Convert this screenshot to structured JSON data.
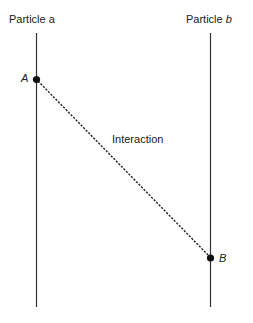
{
  "diagram": {
    "particles": [
      {
        "id": "a",
        "prefix": "Particle ",
        "name": "a",
        "name_italic": false
      },
      {
        "id": "b",
        "prefix": "Particle ",
        "name": "b",
        "name_italic": true
      }
    ],
    "events": [
      {
        "id": "A",
        "label": "A",
        "on_particle": "a"
      },
      {
        "id": "B",
        "label": "B",
        "on_particle": "b"
      }
    ],
    "interaction": {
      "label": "Interaction",
      "from": "A",
      "to": "B",
      "style": "dashed"
    },
    "colors": {
      "line": "#333333",
      "text": "#222222",
      "background": "#ffffff"
    }
  }
}
